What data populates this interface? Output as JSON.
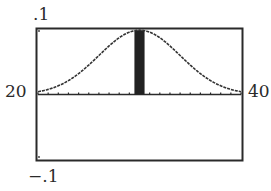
{
  "chart_data": {
    "type": "line",
    "title": "",
    "xlabel": "",
    "ylabel": "",
    "xlim": [
      20,
      40
    ],
    "ylim": [
      -0.1,
      0.1
    ],
    "x_scale_tick": 1,
    "grid": false,
    "legend": null,
    "tick_labels": {
      "xmin": "20",
      "xmax": "40",
      "ymax": ".1",
      "ymin": "−.1"
    },
    "series": [
      {
        "name": "normal density curve",
        "distribution": "normal",
        "mean": 30,
        "std_dev": 4,
        "peak_y": 0.0997
      }
    ],
    "shaded_region": {
      "x_from": 29.5,
      "x_to": 30.5,
      "description": "area under curve between bounds"
    }
  },
  "labels": {
    "ymax": ".1",
    "ymin": "−.1",
    "xmin": "20",
    "xmax": "40"
  },
  "colors": {
    "frame": "#2a2a2a",
    "curve": "#333333",
    "shade": "#222222",
    "background": "#ffffff"
  }
}
